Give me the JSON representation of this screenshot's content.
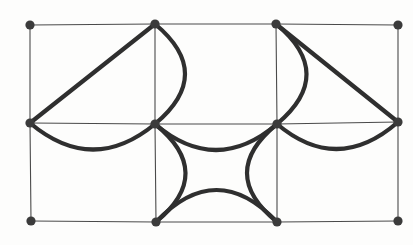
{
  "figure": {
    "title": "Planar grid graph with curved overlay edges",
    "type": "graph-diagram",
    "width": 413,
    "height": 245,
    "background_color": "#fdfdfc",
    "grid_edge_color": "#4a4a4a",
    "heavy_edge_color": "#2f2f2f",
    "vertex_color": "#3b3b3b",
    "vertex_radius": 4.6,
    "grid_stroke_width": 1.1,
    "heavy_stroke_width": 4.2,
    "vertex_count": 12,
    "grid_columns": 4,
    "grid_rows": 3
  },
  "vertices": [
    {
      "id": "n00",
      "label": "top-left",
      "x": 30,
      "y": 25,
      "row": 0,
      "col": 0
    },
    {
      "id": "n01",
      "label": "top-mid-left",
      "x": 155,
      "y": 24,
      "row": 0,
      "col": 1
    },
    {
      "id": "n02",
      "label": "top-mid-right",
      "x": 276,
      "y": 24,
      "row": 0,
      "col": 2
    },
    {
      "id": "n03",
      "label": "top-right",
      "x": 398,
      "y": 25,
      "row": 0,
      "col": 3
    },
    {
      "id": "n10",
      "label": "middle-left",
      "x": 30,
      "y": 123,
      "row": 1,
      "col": 0
    },
    {
      "id": "n11",
      "label": "center-left",
      "x": 155,
      "y": 124,
      "row": 1,
      "col": 1
    },
    {
      "id": "n12",
      "label": "center-right",
      "x": 277,
      "y": 124,
      "row": 1,
      "col": 2
    },
    {
      "id": "n13",
      "label": "middle-right",
      "x": 398,
      "y": 122,
      "row": 1,
      "col": 3
    },
    {
      "id": "n20",
      "label": "bottom-left",
      "x": 31,
      "y": 221,
      "row": 2,
      "col": 0
    },
    {
      "id": "n21",
      "label": "bottom-mid-left",
      "x": 156,
      "y": 222,
      "row": 2,
      "col": 1
    },
    {
      "id": "n22",
      "label": "bottom-mid-right",
      "x": 277,
      "y": 222,
      "row": 2,
      "col": 2
    },
    {
      "id": "n23",
      "label": "bottom-right",
      "x": 398,
      "y": 221,
      "row": 2,
      "col": 3
    }
  ],
  "grid_edges": [
    {
      "id": "g-top-1",
      "from": "n00",
      "to": "n01",
      "orientation": "horizontal"
    },
    {
      "id": "g-top-2",
      "from": "n01",
      "to": "n02",
      "orientation": "horizontal"
    },
    {
      "id": "g-top-3",
      "from": "n02",
      "to": "n03",
      "orientation": "horizontal"
    },
    {
      "id": "g-mid-1",
      "from": "n10",
      "to": "n11",
      "orientation": "horizontal"
    },
    {
      "id": "g-mid-2",
      "from": "n11",
      "to": "n12",
      "orientation": "horizontal"
    },
    {
      "id": "g-mid-3",
      "from": "n12",
      "to": "n13",
      "orientation": "horizontal"
    },
    {
      "id": "g-bot-1",
      "from": "n20",
      "to": "n21",
      "orientation": "horizontal"
    },
    {
      "id": "g-bot-2",
      "from": "n21",
      "to": "n22",
      "orientation": "horizontal"
    },
    {
      "id": "g-bot-3",
      "from": "n22",
      "to": "n23",
      "orientation": "horizontal"
    },
    {
      "id": "g-colA-top",
      "from": "n00",
      "to": "n10",
      "orientation": "vertical"
    },
    {
      "id": "g-colA-bot",
      "from": "n10",
      "to": "n20",
      "orientation": "vertical"
    },
    {
      "id": "g-colB-top",
      "from": "n01",
      "to": "n11",
      "orientation": "vertical"
    },
    {
      "id": "g-colB-bot",
      "from": "n11",
      "to": "n21",
      "orientation": "vertical"
    },
    {
      "id": "g-colC-top",
      "from": "n02",
      "to": "n12",
      "orientation": "vertical"
    },
    {
      "id": "g-colC-bot",
      "from": "n12",
      "to": "n22",
      "orientation": "vertical"
    },
    {
      "id": "g-colD-top",
      "from": "n03",
      "to": "n13",
      "orientation": "vertical"
    },
    {
      "id": "g-colD-bot",
      "from": "n13",
      "to": "n23",
      "orientation": "vertical"
    }
  ],
  "heavy_edges": [
    {
      "id": "h-diag-left",
      "kind": "straight",
      "from": "n10",
      "to": "n01",
      "description": "straight diagonal from middle-left up to top-mid-left"
    },
    {
      "id": "h-diag-right",
      "kind": "straight",
      "from": "n02",
      "to": "n13",
      "description": "straight diagonal from top-mid-right down to middle-right"
    },
    {
      "id": "h-arc-left-vert",
      "kind": "arc",
      "from": "n01",
      "to": "n11",
      "bulge": "right",
      "bulge_amount": 30,
      "description": "arc bulging right between top-mid-left and center-left"
    },
    {
      "id": "h-arc-right-vert",
      "kind": "arc",
      "from": "n02",
      "to": "n12",
      "bulge": "right",
      "bulge_amount": 30,
      "description": "arc bulging right between top-mid-right and center-right"
    },
    {
      "id": "h-arc-mid-row-left",
      "kind": "arc",
      "from": "n10",
      "to": "n11",
      "bulge": "down",
      "bulge_amount": 26,
      "description": "arc sagging down between middle-left and center-left"
    },
    {
      "id": "h-arc-mid-row-center",
      "kind": "arc",
      "from": "n11",
      "to": "n12",
      "bulge": "down",
      "bulge_amount": 26,
      "description": "arc sagging down between center-left and center-right"
    },
    {
      "id": "h-arc-mid-row-right",
      "kind": "arc",
      "from": "n12",
      "to": "n13",
      "bulge": "down",
      "bulge_amount": 26,
      "description": "arc sagging down between center-right and middle-right"
    },
    {
      "id": "h-arc-lower-left-vert",
      "kind": "arc",
      "from": "n11",
      "to": "n21",
      "bulge": "right",
      "bulge_amount": 30,
      "description": "arc bulging right between center-left and bottom-mid-left"
    },
    {
      "id": "h-arc-lower-right-vert",
      "kind": "arc",
      "from": "n12",
      "to": "n22",
      "bulge": "left",
      "bulge_amount": 30,
      "description": "arc bulging left between center-right and bottom-mid-right"
    },
    {
      "id": "h-arc-bottom-row",
      "kind": "arc",
      "from": "n21",
      "to": "n22",
      "bulge": "up",
      "bulge_amount": 32,
      "description": "arc bulging up between bottom-mid-left and bottom-mid-right"
    }
  ]
}
